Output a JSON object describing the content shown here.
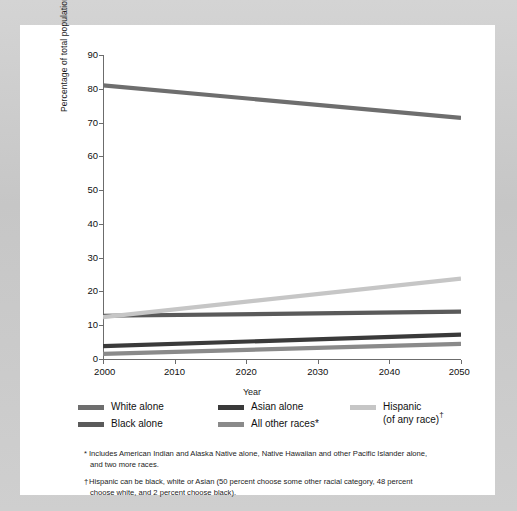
{
  "chart_data": {
    "type": "line",
    "title": "",
    "xlabel": "Year",
    "ylabel": "Percentage of total population",
    "x": [
      2000,
      2050
    ],
    "xlim": [
      2000,
      2050
    ],
    "ylim": [
      0,
      90
    ],
    "xticks": [
      "2000",
      "2010",
      "2020",
      "2030",
      "2040",
      "2050"
    ],
    "yticks": [
      "0",
      "10",
      "20",
      "30",
      "40",
      "50",
      "60",
      "70",
      "80",
      "90"
    ],
    "grid": false,
    "legend_position": "below-axes",
    "series": [
      {
        "name": "White alone",
        "color": "#6e6e6e",
        "values": [
          81.0,
          71.4
        ]
      },
      {
        "name": "Black alone",
        "color": "#5a5a5a",
        "values": [
          12.8,
          14.0
        ]
      },
      {
        "name": "Asian alone",
        "color": "#3a3a3a",
        "values": [
          3.8,
          7.2
        ]
      },
      {
        "name": "All other races*",
        "color": "#8a8a8a",
        "values": [
          1.5,
          4.5
        ]
      },
      {
        "name": "Hispanic (of any race)",
        "color": "#c6c6c6",
        "values": [
          12.4,
          23.8
        ]
      }
    ]
  },
  "axes": {
    "ylabel": "Percentage of total population",
    "xlabel": "Year",
    "yticks": [
      "90",
      "80",
      "70",
      "60",
      "50",
      "40",
      "30",
      "20",
      "10",
      "0"
    ],
    "xticks": [
      "2000",
      "2010",
      "2020",
      "2030",
      "2040",
      "2050"
    ]
  },
  "legend": {
    "items": [
      {
        "label": "White alone",
        "color": "#6e6e6e",
        "dagger": ""
      },
      {
        "label": "Black alone",
        "color": "#5a5a5a",
        "dagger": ""
      },
      {
        "label": "Asian alone",
        "color": "#3a3a3a",
        "dagger": ""
      },
      {
        "label": "All other races*",
        "color": "#8a8a8a",
        "dagger": ""
      },
      {
        "label": "Hispanic",
        "label2": "(of any race)",
        "color": "#c6c6c6",
        "dagger": "†"
      }
    ]
  },
  "footnotes": [
    {
      "mark": "*",
      "line1": "Includes American Indian and Alaska Native alone, Native Hawaiian and other Pacific Islander alone,",
      "line2": "and two more races."
    },
    {
      "mark": "†",
      "line1": "Hispanic can be black, white or Asian (50 percent choose some other racial category, 48 percent",
      "line2": "choose white, and 2 percent choose black)."
    }
  ],
  "colors": {
    "page_background": "#c9c9c9",
    "card_background": "#ffffff",
    "axis": "#6c6c6c",
    "text": "#101010"
  }
}
